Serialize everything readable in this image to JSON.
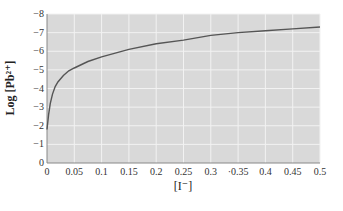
{
  "chart_data": {
    "type": "line",
    "title": "",
    "xlabel": "[I⁻]",
    "ylabel": "Log [Pb²⁺]",
    "xlim": [
      0,
      0.5
    ],
    "ylim": [
      0,
      -8
    ],
    "x_ticks": [
      "0",
      "0.05",
      "0.1",
      "0.15",
      "0.2",
      "0.25",
      "0.3",
      "·0.35",
      "0.4",
      "0.45",
      "0.5"
    ],
    "y_ticks": [
      "0",
      "−1",
      "−2",
      "−3",
      "−4",
      "−5",
      "−6",
      "−7",
      "−8"
    ],
    "grid": true,
    "background": "#d9d9d9",
    "line_color": "#555555",
    "series": [
      {
        "name": "Log [Pb2+]",
        "x": [
          0,
          0.003,
          0.006,
          0.01,
          0.015,
          0.02,
          0.03,
          0.04,
          0.05,
          0.075,
          0.1,
          0.15,
          0.2,
          0.25,
          0.3,
          0.35,
          0.4,
          0.45,
          0.5
        ],
        "y": [
          -1.8,
          -2.6,
          -3.2,
          -3.7,
          -4.1,
          -4.35,
          -4.7,
          -4.95,
          -5.1,
          -5.45,
          -5.7,
          -6.1,
          -6.4,
          -6.6,
          -6.85,
          -7.0,
          -7.1,
          -7.2,
          -7.3
        ]
      }
    ]
  }
}
